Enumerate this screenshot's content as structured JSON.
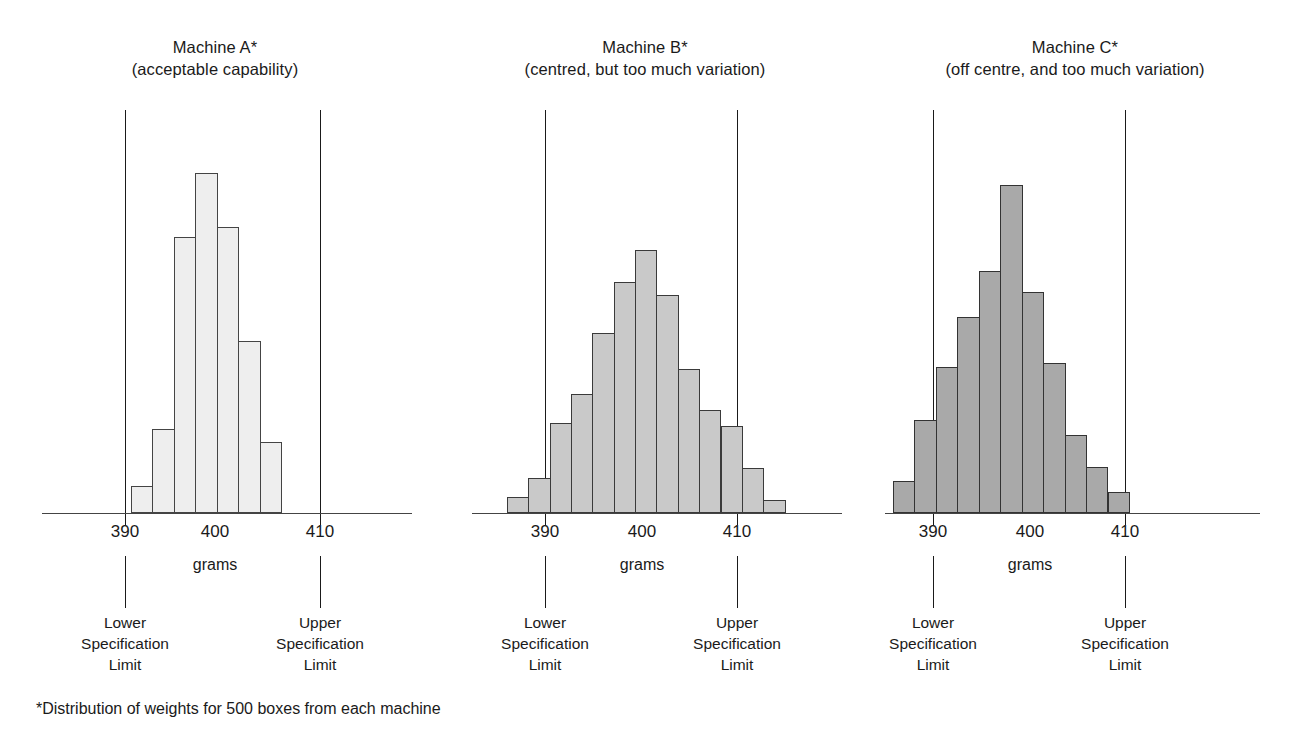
{
  "figure": {
    "footnote": "*Distribution of weights for 500 boxes from each machine",
    "axis_unit_label": "grams",
    "lower_limit_caption_line1": "Lower",
    "lower_limit_caption_line2": "Specification",
    "lower_limit_caption_line3": "Limit",
    "upper_limit_caption_line1": "Upper",
    "upper_limit_caption_line2": "Specification",
    "upper_limit_caption_line3": "Limit",
    "bar_fill_a": "#eeeeee",
    "bar_fill_b": "#c9c9c9",
    "bar_fill_c": "#a9a9a9",
    "outline_color": "#3a3a3a"
  },
  "panels": [
    {
      "id": "machine-a",
      "title_line1": "Machine A*",
      "title_line2": "(acceptable capability)",
      "ticks": [
        "390",
        "400",
        "410"
      ],
      "unit": "grams"
    },
    {
      "id": "machine-b",
      "title_line1": "Machine B*",
      "title_line2": "(centred, but too much variation)",
      "ticks": [
        "390",
        "400",
        "410"
      ],
      "unit": "grams"
    },
    {
      "id": "machine-c",
      "title_line1": "Machine C*",
      "title_line2": "(off centre, and too much variation)",
      "ticks": [
        "390",
        "400",
        "410"
      ],
      "unit": "grams"
    }
  ],
  "chart_data": [
    {
      "type": "bar",
      "title": "Machine A* (acceptable capability)",
      "xlabel": "grams",
      "ylabel": "frequency",
      "grid": false,
      "legend": "none",
      "xlim": [
        386,
        412
      ],
      "bin_width": 2,
      "categories": [
        "388-390",
        "390-392",
        "392-394",
        "394-396",
        "396-398",
        "398-400",
        "400-402"
      ],
      "bin_centers": [
        389,
        391,
        393,
        395,
        397,
        399,
        401
      ],
      "values": [
        8,
        25,
        82,
        101,
        85,
        51,
        21
      ],
      "annotations": [
        {
          "label": "Lower Specification Limit",
          "x": 390
        },
        {
          "label": "Upper Specification Limit",
          "x": 410
        }
      ]
    },
    {
      "type": "bar",
      "title": "Machine B* (centred, but too much variation)",
      "xlabel": "grams",
      "ylabel": "frequency",
      "grid": false,
      "legend": "none",
      "xlim": [
        385,
        416
      ],
      "bin_width": 2,
      "categories": [
        "385-387",
        "387-389",
        "389-391",
        "391-393",
        "393-395",
        "395-397",
        "397-399",
        "399-401",
        "401-403",
        "403-405",
        "405-407",
        "407-409",
        "409-411"
      ],
      "bin_centers": [
        386,
        388,
        390,
        392,
        394,
        396,
        398,
        400,
        402,
        404,
        406,
        408,
        410
      ],
      "values": [
        5,
        11,
        28,
        37,
        56,
        72,
        82,
        68,
        45,
        32,
        27,
        14,
        4
      ],
      "annotations": [
        {
          "label": "Lower Specification Limit",
          "x": 390
        },
        {
          "label": "Upper Specification Limit",
          "x": 410
        }
      ]
    },
    {
      "type": "bar",
      "title": "Machine C* (off centre, and too much variation)",
      "xlabel": "grams",
      "ylabel": "frequency",
      "grid": false,
      "legend": "none",
      "xlim": [
        384,
        412
      ],
      "bin_width": 2,
      "categories": [
        "384-386",
        "386-388",
        "388-390",
        "390-392",
        "392-394",
        "394-396",
        "396-398",
        "398-400",
        "400-402",
        "402-404",
        "404-406"
      ],
      "bin_centers": [
        385,
        387,
        389,
        391,
        393,
        395,
        397,
        399,
        401,
        403,
        405
      ],
      "values": [
        9,
        26,
        41,
        55,
        68,
        92,
        62,
        42,
        22,
        13,
        6
      ],
      "annotations": [
        {
          "label": "Lower Specification Limit",
          "x": 390
        },
        {
          "label": "Upper Specification Limit",
          "x": 410
        }
      ]
    }
  ]
}
